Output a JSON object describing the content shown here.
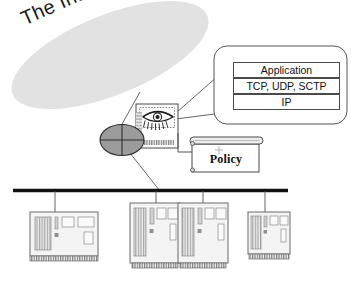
{
  "diagram": {
    "cloud": {
      "label": "The Internet",
      "fill": "#e0e0e0"
    },
    "firewall": {
      "node_name": "firewall-node",
      "icon": "eye-icon",
      "circle_fill": "#9a9a9a"
    },
    "protocol_stack": {
      "layers": [
        {
          "label": "Application"
        },
        {
          "label": "TCP, UDP, SCTP"
        },
        {
          "label": "IP"
        }
      ]
    },
    "policy": {
      "label": "Policy"
    },
    "network": {
      "bus_color": "#111111",
      "hosts": [
        {
          "name": "host-1",
          "orientation": "desktop"
        },
        {
          "name": "host-2",
          "orientation": "tower"
        },
        {
          "name": "host-3",
          "orientation": "tower"
        },
        {
          "name": "host-4",
          "orientation": "tower-small"
        }
      ]
    },
    "colors": {
      "line": "#555555",
      "box_stroke": "#4a4a4a",
      "panel_fill": "#f0f0f0",
      "stripe": "#b9b9b9"
    }
  }
}
